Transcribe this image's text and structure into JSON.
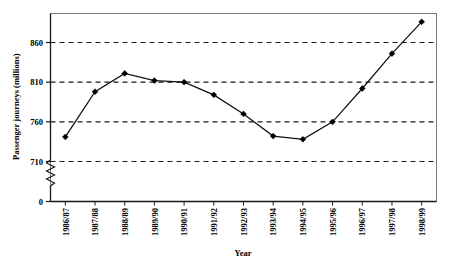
{
  "chart_data": {
    "type": "line",
    "title": "",
    "xlabel": "Year",
    "ylabel": "Passenger journeys (millions)",
    "categories": [
      "1986/87",
      "1987/88",
      "1988/89",
      "1989/90",
      "1990/91",
      "1991/92",
      "1992/93",
      "1993/94",
      "1994/95",
      "1995/96",
      "1996/97",
      "1997/98",
      "1998/99"
    ],
    "values": [
      741,
      798,
      821,
      812,
      810,
      794,
      770,
      742,
      738,
      760,
      802,
      846,
      886
    ],
    "ylim": [
      710,
      890
    ],
    "yticks": [
      710,
      760,
      810,
      860
    ],
    "ytick_labels": [
      "710",
      "760",
      "810",
      "860"
    ],
    "y_zero_label": "0",
    "axis_break": true,
    "grid": true,
    "grid_style": "dashed-horizontal",
    "legend": "none",
    "marker": "filled-diamond",
    "series_color": "#111111"
  },
  "axis": {
    "y_title": "Passenger journeys (millions)",
    "x_title": "Year",
    "zero_label": "0"
  }
}
